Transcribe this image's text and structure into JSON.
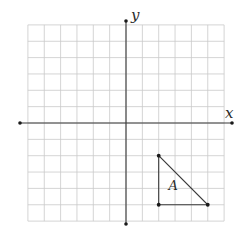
{
  "diagram": {
    "type": "coordinate-plane",
    "axes": {
      "x_label": "x",
      "y_label": "y"
    },
    "grid": {
      "x_min": -6,
      "x_max": 6,
      "y_min": -6,
      "y_max": 6,
      "step": 1
    },
    "shapes": [
      {
        "name": "triangle-A",
        "label": "A",
        "vertices": [
          [
            2,
            -2
          ],
          [
            2,
            -5
          ],
          [
            5,
            -5
          ]
        ]
      }
    ],
    "colors": {
      "grid": "#c9c9c9",
      "axis": "#3a3a3a",
      "points": "#1a1a1a"
    }
  }
}
